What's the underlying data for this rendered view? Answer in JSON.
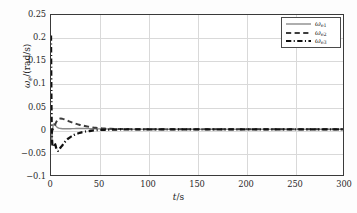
{
  "figure": {
    "background_color": "#fdfdfd",
    "plot_background_color": "#ffffff",
    "frame_color": "#3a3a3a",
    "grid_color": "#d9d9d9"
  },
  "axes": {
    "xlabel_symbol": "t",
    "xlabel_unit": "/s",
    "ylabel_symbol": "ω",
    "ylabel_subscript": "e",
    "ylabel_unit": "/(rad/s)",
    "xticks": [
      "0",
      "50",
      "100",
      "150",
      "200",
      "250",
      "300"
    ],
    "yticks": [
      "0.25",
      "0.2",
      "0.15",
      "0.1",
      "0.05",
      "0",
      "−0.05",
      "−0.1"
    ]
  },
  "legend": {
    "position": "top-right",
    "items": [
      {
        "label_symbol": "ω",
        "label_sub": "e1",
        "style": "solid",
        "color": "#8c8c8c",
        "width": 1.4
      },
      {
        "label_symbol": "ω",
        "label_sub": "e2",
        "style": "dashed",
        "color": "#3d3d3d",
        "width": 2.0
      },
      {
        "label_symbol": "ω",
        "label_sub": "e3",
        "style": "dashdot",
        "color": "#101010",
        "width": 2.2
      }
    ]
  },
  "chart_data": {
    "type": "line",
    "title": "",
    "xlabel": "t/s",
    "ylabel": "ωe/(rad/s)",
    "xlim": [
      0,
      300
    ],
    "ylim": [
      -0.1,
      0.25
    ],
    "grid": true,
    "legend_position": "top-right",
    "xticks": [
      0,
      50,
      100,
      150,
      200,
      250,
      300
    ],
    "yticks": [
      -0.1,
      -0.05,
      0,
      0.05,
      0.1,
      0.15,
      0.2,
      0.25
    ],
    "series": [
      {
        "name": "ωe1",
        "style": "solid",
        "color": "#8c8c8c",
        "x": [
          0,
          0.6,
          1.2,
          2,
          3,
          4,
          5,
          6,
          7,
          8,
          10,
          12,
          15,
          18,
          22,
          26,
          30,
          35,
          40,
          45,
          50,
          60,
          80,
          100,
          150,
          200,
          250,
          300
        ],
        "y": [
          0.0,
          -0.028,
          -0.013,
          0.006,
          0.012,
          0.0105,
          0.0075,
          0.005,
          0.0035,
          0.0025,
          0.0016,
          0.0012,
          0.0011,
          0.0012,
          0.0014,
          0.0016,
          0.0017,
          0.0016,
          0.0014,
          0.0011,
          0.0008,
          0.0005,
          0.0002,
          0.0001,
          0.0,
          0.0,
          0.0,
          0.0
        ]
      },
      {
        "name": "ωe2",
        "style": "dashed",
        "color": "#3d3d3d",
        "x": [
          0,
          0.5,
          1,
          2,
          3,
          4,
          5,
          6,
          7,
          8,
          10,
          12,
          14,
          16,
          18,
          20,
          23,
          26,
          29,
          32,
          35,
          38,
          42,
          46,
          50,
          55,
          60,
          70,
          90,
          120,
          160,
          200,
          250,
          300
        ],
        "y": [
          0.0,
          -0.004,
          -0.003,
          0.0,
          0.004,
          0.009,
          0.014,
          0.018,
          0.021,
          0.0225,
          0.0235,
          0.0228,
          0.0215,
          0.0198,
          0.018,
          0.0162,
          0.0138,
          0.0118,
          0.01,
          0.0085,
          0.007,
          0.0058,
          0.0044,
          0.0032,
          0.0024,
          0.0016,
          0.0011,
          0.0006,
          0.0002,
          0.0001,
          0.0,
          0.0,
          0.0,
          0.0
        ]
      },
      {
        "name": "ωe3",
        "style": "dashdot",
        "color": "#101010",
        "x": [
          0,
          0.25,
          0.5,
          0.8,
          1.2,
          1.8,
          2.5,
          3.5,
          4.5,
          5.5,
          6.5,
          7.5,
          8.5,
          9.5,
          11,
          13,
          15,
          18,
          21,
          25,
          29,
          33,
          37,
          41,
          45,
          50,
          55,
          60,
          70,
          85,
          110,
          150,
          200,
          250,
          300
        ],
        "y": [
          0.205,
          0.12,
          0.05,
          0.0,
          -0.028,
          -0.038,
          -0.034,
          -0.03,
          -0.034,
          -0.042,
          -0.047,
          -0.0465,
          -0.044,
          -0.041,
          -0.037,
          -0.031,
          -0.026,
          -0.02,
          -0.0155,
          -0.0112,
          -0.0082,
          -0.006,
          -0.0044,
          -0.0032,
          -0.0024,
          -0.0016,
          -0.0011,
          -0.0008,
          -0.0004,
          -0.0002,
          -0.0001,
          0.0,
          0.0,
          0.0,
          0.0
        ]
      }
    ]
  }
}
